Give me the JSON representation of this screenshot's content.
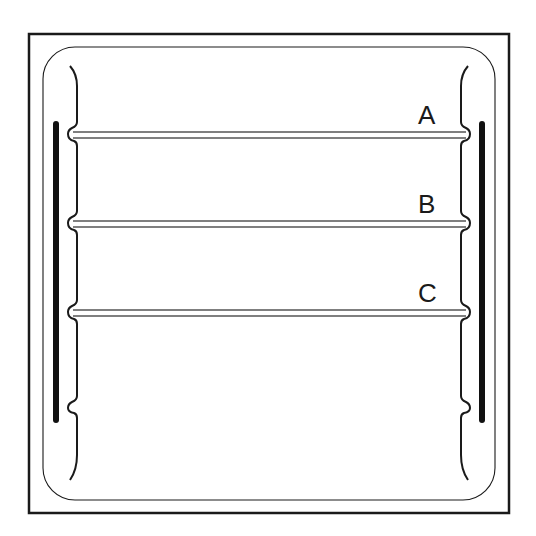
{
  "diagram": {
    "stroke_color": "#1a1a1a",
    "background": "#ffffff",
    "shelves": [
      {
        "label": "A",
        "y": 135
      },
      {
        "label": "B",
        "y": 224
      },
      {
        "label": "C",
        "y": 313
      }
    ],
    "side_rails": [
      "left",
      "right"
    ],
    "support_notches": 4
  }
}
